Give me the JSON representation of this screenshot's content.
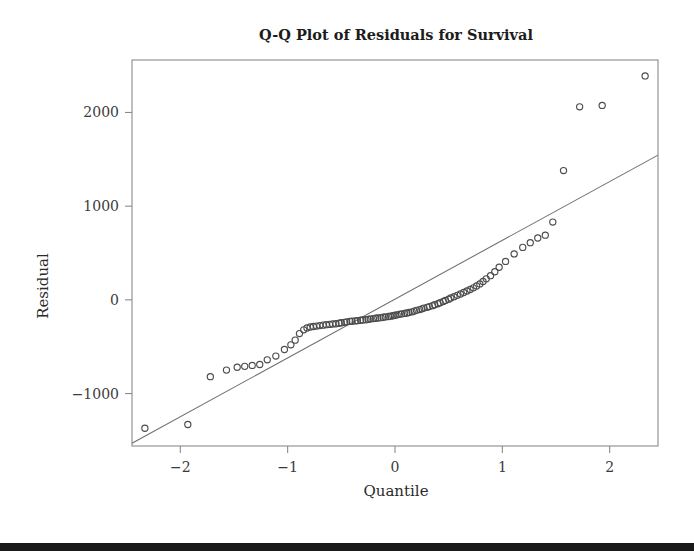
{
  "figure": {
    "title": "Q-Q Plot of Residuals for Survival",
    "background_color": "#ffffff",
    "bottom_bar_color": "#1a1a1a"
  },
  "axes": {
    "x_label": "Quantile",
    "y_label": "Residual",
    "x_ticks": [
      "-2",
      "-1",
      "0",
      "1",
      "2"
    ],
    "y_ticks": [
      "2000",
      "1000",
      "0",
      "-1000"
    ]
  },
  "chart_data": {
    "type": "scatter",
    "title": "Q-Q Plot of Residuals for Survival",
    "xlabel": "Quantile",
    "ylabel": "Residual",
    "xlim": [
      -2.45,
      2.45
    ],
    "ylim": [
      -1560,
      2560
    ],
    "xticks": [
      -2,
      -1,
      0,
      1,
      2
    ],
    "yticks": [
      -1000,
      0,
      1000,
      2000
    ],
    "grid": false,
    "legend": "none",
    "marker": "open-circle",
    "marker_color": "#4d4d4d",
    "reference_line": {
      "name": "theoretical-normal-line",
      "color": "#6e6e6e",
      "x": [
        -2.45,
        2.45
      ],
      "y": [
        -1530,
        1545
      ]
    },
    "series": [
      {
        "name": "Residual quantiles",
        "x": [
          -2.33,
          -1.93,
          -1.72,
          -1.57,
          -1.47,
          -1.4,
          -1.33,
          -1.26,
          -1.19,
          -1.11,
          -1.03,
          -0.97,
          -0.93,
          -0.89,
          -0.85,
          -0.82,
          -0.79,
          -0.76,
          -0.73,
          -0.7,
          -0.67,
          -0.64,
          -0.61,
          -0.58,
          -0.55,
          -0.52,
          -0.5,
          -0.47,
          -0.45,
          -0.42,
          -0.4,
          -0.37,
          -0.35,
          -0.32,
          -0.3,
          -0.27,
          -0.25,
          -0.23,
          -0.2,
          -0.18,
          -0.16,
          -0.13,
          -0.11,
          -0.09,
          -0.06,
          -0.04,
          -0.02,
          0.0,
          0.02,
          0.04,
          0.06,
          0.09,
          0.11,
          0.13,
          0.16,
          0.18,
          0.2,
          0.23,
          0.25,
          0.27,
          0.3,
          0.32,
          0.35,
          0.37,
          0.4,
          0.42,
          0.45,
          0.47,
          0.5,
          0.52,
          0.55,
          0.58,
          0.61,
          0.64,
          0.67,
          0.7,
          0.73,
          0.76,
          0.79,
          0.82,
          0.85,
          0.89,
          0.93,
          0.97,
          1.03,
          1.11,
          1.19,
          1.26,
          1.33,
          1.4,
          1.47,
          1.57,
          1.72,
          1.93,
          2.33
        ],
        "y": [
          -1370,
          -1330,
          -820,
          -750,
          -720,
          -710,
          -700,
          -690,
          -640,
          -600,
          -530,
          -480,
          -430,
          -360,
          -320,
          -300,
          -290,
          -285,
          -280,
          -275,
          -270,
          -265,
          -262,
          -258,
          -255,
          -250,
          -245,
          -240,
          -235,
          -230,
          -228,
          -225,
          -222,
          -218,
          -215,
          -212,
          -208,
          -205,
          -200,
          -197,
          -194,
          -190,
          -186,
          -182,
          -178,
          -174,
          -170,
          -165,
          -160,
          -155,
          -150,
          -145,
          -140,
          -135,
          -128,
          -120,
          -112,
          -104,
          -96,
          -88,
          -80,
          -72,
          -62,
          -52,
          -42,
          -30,
          -18,
          -6,
          6,
          20,
          34,
          48,
          62,
          78,
          94,
          110,
          128,
          148,
          170,
          196,
          224,
          258,
          300,
          348,
          410,
          490,
          560,
          610,
          660,
          690,
          830,
          1380,
          2060,
          2075,
          2390
        ]
      }
    ],
    "annotations": [
      "Points deviate above the reference line at both tails, indicating heavy right tail.",
      "Three extreme high outliers near quantiles 1.7, 1.9 and 2.3."
    ]
  }
}
